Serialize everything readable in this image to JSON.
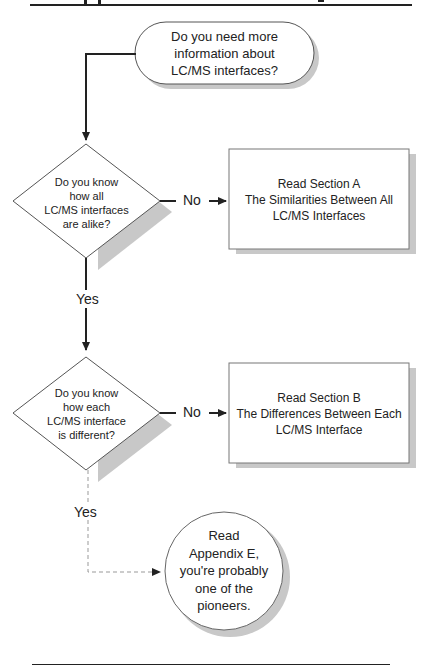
{
  "page": {
    "top_rule": true,
    "bottom_rule": true
  },
  "flowchart": {
    "start": {
      "text_lines": [
        "Do you need more",
        "information about",
        "LC/MS interfaces?"
      ]
    },
    "decision1": {
      "text_lines": [
        "Do you know",
        "how all",
        "LC/MS interfaces",
        "are alike?"
      ],
      "no_label": "No",
      "yes_label": "Yes"
    },
    "box_a": {
      "text_lines": [
        "Read Section A",
        "The Similarities Between All",
        "LC/MS Interfaces"
      ]
    },
    "decision2": {
      "text_lines": [
        "Do you know",
        "how each",
        "LC/MS interface",
        "is different?"
      ],
      "no_label": "No",
      "yes_label": "Yes"
    },
    "box_b": {
      "text_lines": [
        "Read Section B",
        "The Differences Between Each",
        "LC/MS Interface"
      ]
    },
    "end": {
      "text_lines": [
        "Read",
        "Appendix E,",
        "you're probably",
        "one of the",
        "pioneers."
      ]
    }
  },
  "colors": {
    "line": "#222222",
    "shadow": "#c8c8c8",
    "node_fill": "#ffffff"
  }
}
